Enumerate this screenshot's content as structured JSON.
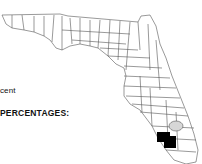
{
  "document": {
    "text_fragment_1": "cent",
    "text_fragment_2": "PERCENTAGES:"
  },
  "map": {
    "region": "Florida counties",
    "highlighted_county_color": "#000000",
    "lake_pattern": "hatched",
    "outline_color": "#555555"
  }
}
